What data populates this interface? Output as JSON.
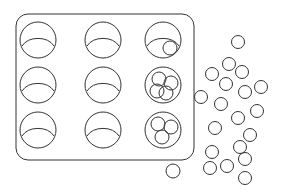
{
  "illustration": {
    "description": "Sketch of a 3x3 muffin tray with balls in some cups and loose balls scattered to the right",
    "stroke_color": "#333333",
    "background": "#ffffff",
    "tray": {
      "x": 16,
      "y": 14,
      "width": 178,
      "height": 146,
      "rx": 12
    },
    "cups": [
      {
        "row": 0,
        "col": 0,
        "cx": 38,
        "cy": 40,
        "balls": 0
      },
      {
        "row": 0,
        "col": 1,
        "cx": 103,
        "cy": 40,
        "balls": 0
      },
      {
        "row": 0,
        "col": 2,
        "cx": 163,
        "cy": 40,
        "balls": 1
      },
      {
        "row": 1,
        "col": 0,
        "cx": 38,
        "cy": 85,
        "balls": 0
      },
      {
        "row": 1,
        "col": 1,
        "cx": 103,
        "cy": 85,
        "balls": 0
      },
      {
        "row": 1,
        "col": 2,
        "cx": 163,
        "cy": 85,
        "balls": 4
      },
      {
        "row": 2,
        "col": 0,
        "cx": 38,
        "cy": 130,
        "balls": 0
      },
      {
        "row": 2,
        "col": 1,
        "cx": 103,
        "cy": 130,
        "balls": 0
      },
      {
        "row": 2,
        "col": 2,
        "cx": 163,
        "cy": 130,
        "balls": 4
      }
    ],
    "loose_ball_count": 20
  }
}
